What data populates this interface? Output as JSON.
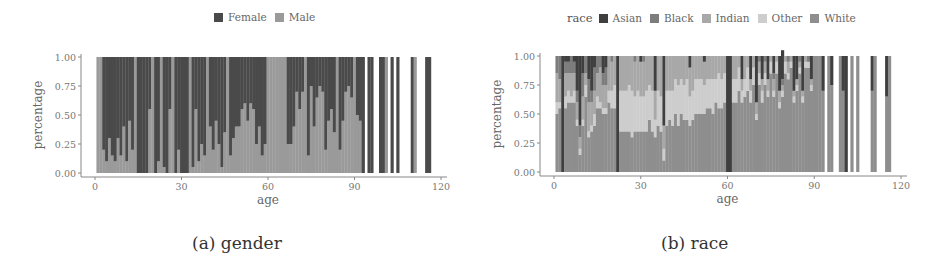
{
  "colors": {
    "Female": "#4a4a4a",
    "Male": "#9a9a9a",
    "Asian": "#3f3f3f",
    "Black": "#7d7d7d",
    "Indian": "#a8a8a8",
    "Other": "#cdcdcd",
    "White": "#8e8e8e"
  },
  "panels": {
    "a": {
      "caption": "(a) gender",
      "xlabel": "age",
      "ylabel": "percentage",
      "legend": {
        "title": "",
        "items": [
          "Female",
          "Male"
        ]
      }
    },
    "b": {
      "caption": "(b) race",
      "xlabel": "age",
      "ylabel": "percentage",
      "legend": {
        "title": "race",
        "items": [
          "Asian",
          "Black",
          "Indian",
          "Other",
          "White"
        ]
      }
    }
  },
  "chart_data": [
    {
      "type": "bar",
      "stacked": true,
      "normalized": true,
      "title": "(a) gender",
      "xlabel": "age",
      "ylabel": "percentage",
      "xlim": [
        0,
        120
      ],
      "ylim": [
        0,
        1
      ],
      "xticks": [
        0,
        30,
        60,
        90,
        120
      ],
      "yticks": [
        "0.00",
        "0.25",
        "0.50",
        "0.75",
        "1.00"
      ],
      "legend": [
        "Female",
        "Male"
      ],
      "legend_position": "top",
      "grid": false,
      "x": [
        1,
        2,
        3,
        4,
        5,
        6,
        7,
        8,
        9,
        10,
        11,
        12,
        13,
        14,
        15,
        16,
        17,
        18,
        19,
        20,
        21,
        22,
        23,
        24,
        25,
        26,
        27,
        28,
        29,
        30,
        31,
        32,
        33,
        34,
        35,
        36,
        37,
        38,
        39,
        40,
        41,
        42,
        43,
        44,
        45,
        46,
        47,
        48,
        49,
        50,
        51,
        52,
        53,
        54,
        55,
        56,
        57,
        58,
        59,
        60,
        61,
        62,
        63,
        64,
        65,
        66,
        67,
        68,
        69,
        70,
        71,
        72,
        73,
        74,
        75,
        76,
        77,
        78,
        79,
        80,
        81,
        82,
        83,
        84,
        85,
        86,
        87,
        88,
        89,
        90,
        91,
        92,
        93,
        95,
        96,
        99,
        100,
        101,
        103,
        105,
        110,
        111,
        115,
        116
      ],
      "series": [
        {
          "name": "Female",
          "values": [
            0.0,
            0.0,
            0.8,
            0.9,
            0.7,
            0.85,
            0.9,
            0.7,
            0.85,
            0.6,
            0.9,
            0.55,
            0.8,
            0.0,
            1.0,
            1.0,
            1.0,
            1.0,
            0.45,
            0.0,
            1.0,
            0.9,
            0.0,
            0.95,
            1.0,
            0.45,
            0.0,
            1.0,
            0.8,
            1.0,
            1.0,
            1.0,
            0.0,
            0.95,
            0.45,
            0.9,
            0.75,
            0.85,
            0.0,
            0.6,
            0.8,
            0.55,
            0.75,
            0.95,
            0.65,
            0.0,
            0.85,
            0.7,
            0.6,
            0.6,
            0.45,
            0.4,
            0.55,
            0.4,
            0.45,
            0.75,
            0.6,
            0.85,
            0.75,
            0.0,
            0.0,
            0.0,
            0.0,
            0.0,
            0.0,
            0.0,
            0.75,
            0.75,
            0.6,
            0.3,
            0.45,
            0.3,
            0.0,
            0.85,
            0.25,
            0.6,
            0.35,
            0.25,
            0.3,
            0.8,
            0.55,
            0.45,
            0.65,
            0.0,
            0.8,
            0.55,
            0.3,
            0.25,
            0.35,
            0.0,
            0.5,
            0.55,
            1.0,
            1.0,
            1.0,
            1.0,
            1.0,
            0.0,
            1.0,
            1.0,
            1.0,
            0.0,
            1.0,
            1.0
          ]
        },
        {
          "name": "Male",
          "values": [
            1.0,
            1.0,
            0.2,
            0.1,
            0.3,
            0.15,
            0.1,
            0.3,
            0.15,
            0.4,
            0.1,
            0.45,
            0.2,
            1.0,
            0.0,
            0.0,
            0.0,
            0.0,
            0.55,
            1.0,
            0.0,
            0.1,
            1.0,
            0.05,
            0.0,
            0.55,
            1.0,
            0.0,
            0.2,
            0.0,
            0.0,
            0.0,
            1.0,
            0.05,
            0.55,
            0.1,
            0.25,
            0.15,
            1.0,
            0.4,
            0.2,
            0.45,
            0.25,
            0.05,
            0.35,
            1.0,
            0.15,
            0.3,
            0.4,
            0.4,
            0.55,
            0.6,
            0.45,
            0.6,
            0.55,
            0.25,
            0.4,
            0.15,
            0.25,
            1.0,
            1.0,
            1.0,
            1.0,
            1.0,
            1.0,
            1.0,
            0.25,
            0.25,
            0.4,
            0.7,
            0.55,
            0.7,
            1.0,
            0.15,
            0.75,
            0.4,
            0.65,
            0.75,
            0.7,
            0.2,
            0.45,
            0.55,
            0.35,
            1.0,
            0.2,
            0.45,
            0.7,
            0.75,
            0.65,
            1.0,
            0.5,
            0.45,
            0.0,
            0.0,
            0.0,
            0.0,
            0.0,
            1.0,
            0.0,
            0.0,
            0.0,
            1.0,
            0.0,
            0.0
          ]
        }
      ]
    },
    {
      "type": "bar",
      "stacked": true,
      "normalized": true,
      "title": "(b) race",
      "xlabel": "age",
      "ylabel": "percentage",
      "xlim": [
        0,
        120
      ],
      "ylim": [
        0,
        1
      ],
      "xticks": [
        0,
        30,
        60,
        90,
        120
      ],
      "yticks": [
        "0.00",
        "0.25",
        "0.50",
        "0.75",
        "1.00"
      ],
      "legend_title": "race",
      "legend": [
        "Asian",
        "Black",
        "Indian",
        "Other",
        "White"
      ],
      "legend_position": "top",
      "grid": false,
      "x": [
        1,
        2,
        3,
        4,
        5,
        6,
        7,
        8,
        9,
        10,
        11,
        12,
        13,
        14,
        15,
        16,
        17,
        18,
        19,
        20,
        21,
        22,
        23,
        24,
        25,
        26,
        27,
        28,
        29,
        30,
        31,
        32,
        33,
        34,
        35,
        36,
        37,
        38,
        39,
        40,
        41,
        42,
        43,
        44,
        45,
        46,
        47,
        48,
        49,
        50,
        51,
        52,
        53,
        54,
        55,
        56,
        57,
        58,
        59,
        60,
        61,
        62,
        63,
        64,
        65,
        66,
        67,
        68,
        69,
        70,
        71,
        72,
        73,
        74,
        75,
        76,
        77,
        78,
        79,
        80,
        81,
        82,
        83,
        84,
        85,
        86,
        87,
        88,
        89,
        90,
        91,
        92,
        93,
        95,
        96,
        99,
        100,
        101,
        103,
        105,
        110,
        111,
        115,
        116
      ],
      "series": [
        {
          "name": "Asian",
          "values": [
            0.0,
            0.0,
            1.0,
            0.05,
            0.05,
            0.0,
            0.05,
            0.3,
            0.6,
            0.15,
            0.0,
            0.2,
            0.3,
            0.1,
            0.0,
            0.0,
            0.15,
            0.1,
            0.0,
            0.0,
            0.0,
            1.0,
            0.0,
            0.0,
            0.0,
            0.0,
            0.0,
            0.0,
            0.0,
            0.05,
            0.0,
            0.0,
            0.0,
            0.0,
            0.3,
            0.0,
            0.0,
            0.6,
            0.0,
            0.0,
            0.0,
            0.0,
            0.0,
            0.0,
            0.0,
            0.0,
            0.1,
            0.0,
            0.0,
            0.0,
            0.0,
            0.05,
            0.0,
            0.0,
            0.0,
            0.0,
            0.0,
            0.0,
            0.0,
            1.0,
            1.0,
            0.0,
            0.0,
            0.0,
            0.2,
            0.0,
            0.0,
            0.2,
            0.0,
            0.4,
            0.0,
            0.2,
            0.0,
            0.2,
            0.0,
            0.15,
            0.0,
            0.3,
            0.25,
            0.0,
            0.0,
            0.0,
            0.3,
            0.2,
            0.0,
            0.3,
            0.0,
            0.0,
            0.2,
            0.0,
            0.0,
            0.0,
            0.3,
            0.0,
            0.25,
            0.0,
            0.3,
            1.0,
            0.0,
            0.0,
            0.3,
            0.0,
            0.35,
            0.0
          ]
        },
        {
          "name": "Black",
          "values": [
            0.15,
            0.2,
            0.0,
            0.1,
            0.1,
            0.15,
            0.1,
            0.1,
            0.1,
            0.2,
            0.15,
            0.2,
            0.1,
            0.2,
            0.15,
            0.1,
            0.1,
            0.15,
            0.0,
            0.05,
            0.0,
            0.0,
            0.0,
            0.0,
            0.0,
            0.0,
            0.0,
            0.05,
            0.0,
            0.0,
            0.05,
            0.0,
            0.0,
            0.0,
            0.0,
            0.0,
            0.0,
            0.0,
            0.0,
            0.0,
            0.0,
            0.0,
            0.0,
            0.0,
            0.0,
            0.0,
            0.0,
            0.0,
            0.0,
            0.0,
            0.0,
            0.0,
            0.0,
            0.0,
            0.0,
            0.0,
            0.0,
            0.0,
            0.0,
            0.0,
            0.0,
            0.0,
            0.0,
            0.0,
            0.0,
            0.0,
            0.0,
            0.0,
            0.0,
            0.0,
            0.05,
            0.0,
            0.05,
            0.0,
            0.0,
            0.05,
            0.0,
            0.0,
            0.05,
            0.0,
            0.05,
            0.0,
            0.0,
            0.0,
            0.05,
            0.0,
            0.0,
            0.05,
            0.0,
            0.0,
            0.0,
            0.0,
            0.0,
            0.0,
            0.0,
            0.0,
            0.0,
            0.0,
            0.0,
            0.0,
            0.0,
            0.0,
            0.0,
            0.0
          ]
        },
        {
          "name": "Indian",
          "values": [
            0.25,
            0.2,
            0.0,
            0.2,
            0.15,
            0.2,
            0.15,
            0.15,
            0.1,
            0.2,
            0.1,
            0.25,
            0.2,
            0.2,
            0.2,
            0.3,
            0.2,
            0.2,
            0.3,
            0.25,
            0.25,
            0.0,
            0.3,
            0.3,
            0.3,
            0.25,
            0.3,
            0.3,
            0.3,
            0.3,
            0.3,
            0.3,
            0.25,
            0.3,
            0.25,
            0.3,
            0.35,
            0.2,
            0.3,
            0.3,
            0.3,
            0.2,
            0.25,
            0.2,
            0.25,
            0.2,
            0.25,
            0.3,
            0.2,
            0.2,
            0.2,
            0.2,
            0.2,
            0.2,
            0.2,
            0.2,
            0.15,
            0.2,
            0.15,
            0.0,
            0.0,
            0.2,
            0.2,
            0.1,
            0.1,
            0.2,
            0.1,
            0.1,
            0.1,
            0.1,
            0.1,
            0.1,
            0.1,
            0.1,
            0.05,
            0.1,
            0.05,
            0.1,
            0.05,
            0.05,
            0.1,
            0.05,
            0.05,
            0.05,
            0.05,
            0.05,
            0.05,
            0.0,
            0.05,
            0.0,
            0.0,
            0.0,
            0.0,
            0.0,
            0.0,
            0.0,
            0.0,
            0.0,
            0.0,
            0.0,
            0.0,
            0.0,
            0.0,
            0.0
          ]
        },
        {
          "name": "Other",
          "values": [
            0.1,
            0.05,
            0.0,
            0.1,
            0.1,
            0.05,
            0.1,
            0.05,
            0.05,
            0.05,
            0.1,
            0.05,
            0.05,
            0.1,
            0.1,
            0.05,
            0.05,
            0.05,
            0.1,
            0.15,
            0.2,
            0.0,
            0.35,
            0.35,
            0.35,
            0.4,
            0.4,
            0.3,
            0.35,
            0.3,
            0.3,
            0.35,
            0.3,
            0.35,
            0.15,
            0.3,
            0.3,
            0.1,
            0.3,
            0.25,
            0.3,
            0.3,
            0.35,
            0.3,
            0.3,
            0.35,
            0.25,
            0.25,
            0.3,
            0.3,
            0.3,
            0.25,
            0.25,
            0.25,
            0.3,
            0.2,
            0.3,
            0.25,
            0.25,
            0.0,
            0.0,
            0.2,
            0.2,
            0.2,
            0.1,
            0.15,
            0.2,
            0.1,
            0.15,
            0.05,
            0.1,
            0.1,
            0.1,
            0.05,
            0.1,
            0.05,
            0.1,
            0.05,
            0.05,
            0.1,
            0.05,
            0.05,
            0.05,
            0.05,
            0.05,
            0.05,
            0.05,
            0.05,
            0.05,
            0.0,
            0.0,
            0.0,
            0.0,
            0.0,
            0.0,
            0.0,
            0.0,
            0.0,
            0.0,
            0.0,
            0.0,
            0.0,
            0.0,
            0.0
          ]
        },
        {
          "name": "White",
          "values": [
            0.5,
            0.55,
            0.0,
            0.55,
            0.6,
            0.6,
            0.6,
            0.4,
            0.15,
            0.4,
            0.65,
            0.3,
            0.35,
            0.4,
            0.55,
            0.55,
            0.5,
            0.5,
            0.6,
            0.55,
            0.55,
            0.0,
            0.35,
            0.35,
            0.35,
            0.35,
            0.3,
            0.35,
            0.35,
            0.35,
            0.35,
            0.35,
            0.45,
            0.35,
            0.3,
            0.4,
            0.35,
            0.1,
            0.4,
            0.45,
            0.4,
            0.5,
            0.4,
            0.5,
            0.45,
            0.45,
            0.4,
            0.45,
            0.5,
            0.5,
            0.5,
            0.5,
            0.55,
            0.55,
            0.5,
            0.6,
            0.55,
            0.55,
            0.6,
            0.0,
            0.0,
            0.6,
            0.6,
            0.7,
            0.6,
            0.65,
            0.7,
            0.6,
            0.75,
            0.45,
            0.75,
            0.6,
            0.75,
            0.65,
            0.85,
            0.65,
            0.85,
            0.55,
            0.65,
            0.85,
            0.8,
            0.9,
            0.6,
            0.7,
            0.85,
            0.6,
            0.9,
            0.9,
            0.7,
            1.0,
            1.0,
            1.0,
            0.7,
            1.0,
            0.75,
            1.0,
            0.7,
            0.0,
            1.0,
            1.0,
            0.7,
            1.0,
            0.65,
            1.0
          ]
        }
      ]
    }
  ]
}
